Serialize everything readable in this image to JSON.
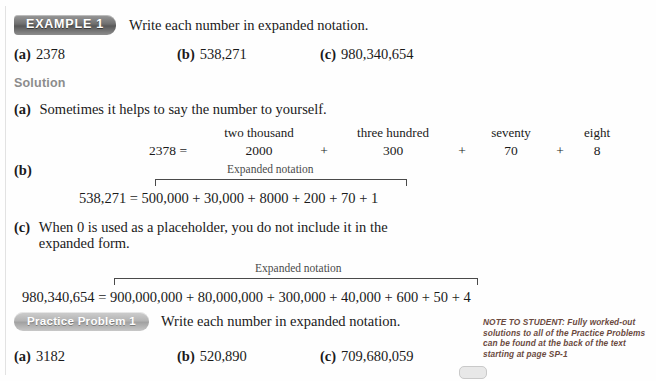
{
  "example": {
    "badge_label": "EXAMPLE 1",
    "instruction": "Write each number in expanded notation.",
    "problems": [
      {
        "label": "(a)",
        "value": "2378"
      },
      {
        "label": "(b)",
        "value": "538,271"
      },
      {
        "label": "(c)",
        "value": "980,340,654"
      }
    ]
  },
  "solution": {
    "heading": "Solution",
    "part_a": {
      "label": "(a)",
      "text": "Sometimes it helps to say the number to yourself.",
      "words": [
        "two thousand",
        "three hundred",
        "seventy",
        "eight"
      ],
      "lead": "2378  =",
      "terms": [
        "2000",
        "300",
        "70",
        "8"
      ],
      "operators": [
        "+",
        "+",
        "+"
      ]
    },
    "part_b": {
      "label": "(b)",
      "brace_label": "Expanded notation",
      "equation": "538,271  =  500,000 + 30,000 + 8000 + 200 + 70 + 1",
      "left": "538,271",
      "equals": "=",
      "terms": [
        "500,000",
        "30,000",
        "8000",
        "200",
        "70",
        "1"
      ]
    },
    "part_c": {
      "label": "(c)",
      "text": "When 0 is used as a placeholder, you do not include it in the expanded form.",
      "brace_label": "Expanded notation",
      "equation": "980,340,654  =  900,000,000 + 80,000,000 + 300,000 + 40,000 + 600 + 50 + 4",
      "left": "980,340,654",
      "equals": "=",
      "terms": [
        "900,000,000",
        "80,000,000",
        "300,000",
        "40,000",
        "600",
        "50",
        "4"
      ]
    }
  },
  "practice": {
    "badge_label": "Practice Problem 1",
    "instruction": "Write each number in expanded notation.",
    "problems": [
      {
        "label": "(a)",
        "value": "3182"
      },
      {
        "label": "(b)",
        "value": "520,890"
      },
      {
        "label": "(c)",
        "value": "709,680,059"
      }
    ]
  },
  "note": {
    "lead": "NOTE TO STUDENT:",
    "body": " Fully worked-out solutions to all of the Practice Problems can be found at the back of the text starting at page SP-1"
  },
  "colors": {
    "page_background": "#fefefe",
    "body_text": "#1a1a1a",
    "solution_heading": "#8c8c8c",
    "example_badge": "#6f6f6f",
    "practice_badge": "#b4b4b4",
    "note_text": "#6b4a3f",
    "brace_rule": "#4a4a4a"
  }
}
